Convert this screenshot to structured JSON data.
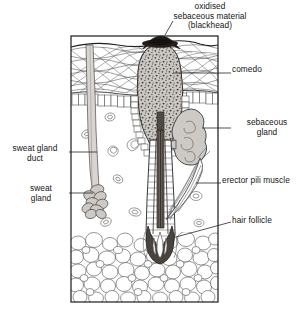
{
  "figure": {
    "frame": {
      "x": 71,
      "y": 36,
      "width": 147,
      "height": 266
    }
  },
  "labels": {
    "oxidised_sebaceous_material": "oxidised\nsebaceous material\n(blackhead)",
    "comedo": "comedo",
    "sebaceous_gland": "sebaceous\ngland",
    "erector_pili_muscle": "erector pili muscle",
    "hair_follicle": "hair follicle",
    "sweat_gland_duct": "sweat gland\nduct",
    "sweat_gland": "sweat\ngland"
  },
  "structures": [
    {
      "name": "epidermis",
      "description": "cross-hatched wavy collagen layer at skin surface"
    },
    {
      "name": "basal-cell-layer",
      "description": "row of small rectangular cells beneath epidermis"
    },
    {
      "name": "dermis",
      "description": "open region containing blood vessel cross-sections"
    },
    {
      "name": "subcutaneous-fat",
      "description": "packed rounded adipose cells at base"
    },
    {
      "name": "comedo-mass",
      "description": "stippled grey plug filling the dilated follicle"
    },
    {
      "name": "blackhead-cap",
      "description": "dark oxidised cap at the skin surface opening"
    },
    {
      "name": "sebaceous-gland",
      "description": "lobed grey gland attached to right of follicle"
    },
    {
      "name": "hair-follicle",
      "description": "vertical duct with hair shaft and bulb"
    },
    {
      "name": "hair-bulb",
      "description": "flame-shaped dermal papilla at follicle base"
    },
    {
      "name": "erector-pili-muscle",
      "description": "fibrous muscle band running to follicle"
    },
    {
      "name": "sweat-gland-duct",
      "description": "pale tube descending from epidermis"
    },
    {
      "name": "sweat-gland",
      "description": "coiled tubular gland at duct base"
    }
  ],
  "colors": {
    "ink": "#1a1a1a",
    "line": "#3a3a3a",
    "fill_light": "#ffffff",
    "comedo_fill": "#c9c6c1",
    "gland_fill": "#cdcac5",
    "duct_fill": "#d8d5d1",
    "hair_fill": "#5a5550",
    "blackhead": "#1d1a18",
    "fat_fill": "#fdfdfd"
  }
}
